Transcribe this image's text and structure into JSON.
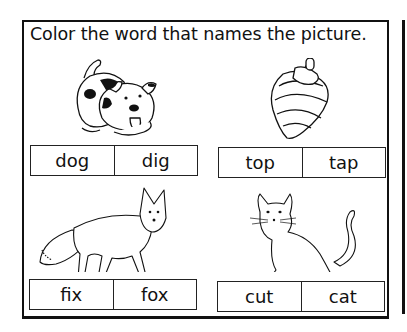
{
  "worksheet": {
    "instruction": "Color the word that names the picture.",
    "items": [
      {
        "picture": "dog",
        "choices": [
          "dog",
          "dig"
        ]
      },
      {
        "picture": "spinning-top",
        "choices": [
          "top",
          "tap"
        ]
      },
      {
        "picture": "fox",
        "choices": [
          "fix",
          "fox"
        ]
      },
      {
        "picture": "cat",
        "choices": [
          "cut",
          "cat"
        ]
      }
    ]
  }
}
